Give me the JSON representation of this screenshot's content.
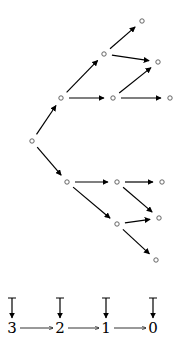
{
  "diagram": {
    "type": "branching tree with chain",
    "colors": {
      "stroke": "#000000",
      "node": "#555555",
      "background": "#ffffff"
    },
    "tree": {
      "nodes": [
        {
          "id": "root",
          "x": 32,
          "y": 141
        },
        {
          "id": "a",
          "x": 61,
          "y": 98
        },
        {
          "id": "b",
          "x": 67,
          "y": 182
        },
        {
          "id": "c",
          "x": 104,
          "y": 54
        },
        {
          "id": "d",
          "x": 113,
          "y": 98
        },
        {
          "id": "e",
          "x": 142,
          "y": 21
        },
        {
          "id": "f",
          "x": 158,
          "y": 62
        },
        {
          "id": "g",
          "x": 170,
          "y": 98
        },
        {
          "id": "h",
          "x": 117,
          "y": 182
        },
        {
          "id": "i",
          "x": 117,
          "y": 224
        },
        {
          "id": "j",
          "x": 162,
          "y": 182
        },
        {
          "id": "k",
          "x": 159,
          "y": 218
        },
        {
          "id": "l",
          "x": 156,
          "y": 260
        }
      ],
      "edges": [
        {
          "from": "root",
          "to": "a"
        },
        {
          "from": "root",
          "to": "b"
        },
        {
          "from": "a",
          "to": "c"
        },
        {
          "from": "a",
          "to": "d"
        },
        {
          "from": "c",
          "to": "e"
        },
        {
          "from": "c",
          "to": "f"
        },
        {
          "from": "d",
          "to": "f"
        },
        {
          "from": "d",
          "to": "g"
        },
        {
          "from": "b",
          "to": "h"
        },
        {
          "from": "b",
          "to": "i"
        },
        {
          "from": "h",
          "to": "j"
        },
        {
          "from": "h",
          "to": "k"
        },
        {
          "from": "i",
          "to": "k"
        },
        {
          "from": "i",
          "to": "l"
        }
      ]
    },
    "chain": {
      "labels": [
        "3",
        "2",
        "1",
        "0"
      ],
      "label_x": [
        12,
        60,
        106,
        153
      ],
      "label_y": 333,
      "tbar_top": 298,
      "tbar_bottom": 318
    }
  }
}
